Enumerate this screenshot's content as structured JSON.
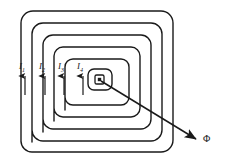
{
  "figure": {
    "background_color": "#ffffff",
    "line_color": "#1a1a1a",
    "width": 226,
    "height": 164
  },
  "coil": {
    "turns": 5,
    "shape": "rounded-square-spiral",
    "corner_radius": 12,
    "outer_rect": {
      "x": 21,
      "y": 11,
      "width": 152,
      "height": 141
    },
    "turn_spacing": 11,
    "stroke_width": 1.4
  },
  "center_node": {
    "name": "flux-center-dot",
    "x": 99,
    "y": 79,
    "outer_size": 9,
    "inner_size": 3.2
  },
  "currents": [
    {
      "label": "I",
      "subscript": "1",
      "label_x": 20,
      "label_y": 65,
      "arrow_x": 25,
      "arrow_top": 76,
      "arrow_bottom": 95
    },
    {
      "label": "I",
      "subscript": "2",
      "label_x": 40,
      "label_y": 65,
      "arrow_x": 45,
      "arrow_top": 76,
      "arrow_bottom": 95
    },
    {
      "label": "I",
      "subscript": "3",
      "label_x": 59,
      "label_y": 65,
      "arrow_x": 64,
      "arrow_top": 76,
      "arrow_bottom": 95
    },
    {
      "label": "I",
      "subscript": "4",
      "label_x": 78,
      "label_y": 65,
      "arrow_x": 83,
      "arrow_top": 76,
      "arrow_bottom": 95
    }
  ],
  "flux": {
    "symbol": "Φ",
    "label_x": 205,
    "label_y": 138,
    "pointer_start": {
      "x": 101,
      "y": 81
    },
    "pointer_end": {
      "x": 198,
      "y": 140
    }
  }
}
